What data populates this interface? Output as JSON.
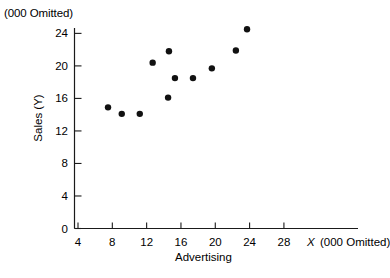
{
  "figure": {
    "unit_note_top": "(000 Omitted)",
    "unit_note_right": "(000 Omitted)",
    "x_symbol": "X",
    "x_caption": "Advertising",
    "y_caption": "Sales (Y)"
  },
  "chart_data": {
    "type": "scatter",
    "title": "",
    "xlabel": "Advertising",
    "ylabel": "Sales (Y)",
    "xlim": [
      4,
      29.5
    ],
    "ylim": [
      0,
      25.8
    ],
    "x_ticks": [
      4,
      8,
      12,
      16,
      20,
      24,
      28
    ],
    "y_ticks": [
      0,
      4,
      8,
      12,
      16,
      20,
      24
    ],
    "x_tick_labels": [
      "4",
      "8",
      "12",
      "16",
      "20",
      "24",
      "28"
    ],
    "y_tick_labels": [
      "0",
      "4",
      "8",
      "12",
      "16",
      "20",
      "24"
    ],
    "grid": false,
    "legend": null,
    "x_units_note": "(000 Omitted)",
    "y_units_note": "(000 Omitted)",
    "points": [
      {
        "x": 7.5,
        "y": 14.9
      },
      {
        "x": 9.1,
        "y": 14.1
      },
      {
        "x": 11.2,
        "y": 14.1
      },
      {
        "x": 12.7,
        "y": 20.4
      },
      {
        "x": 14.5,
        "y": 16.1
      },
      {
        "x": 14.6,
        "y": 21.8
      },
      {
        "x": 15.3,
        "y": 18.5
      },
      {
        "x": 17.4,
        "y": 18.5
      },
      {
        "x": 19.6,
        "y": 19.7
      },
      {
        "x": 22.4,
        "y": 21.9
      },
      {
        "x": 23.7,
        "y": 24.5
      }
    ]
  }
}
